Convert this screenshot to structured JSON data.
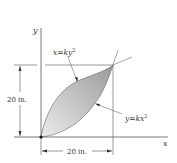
{
  "figure": {
    "axes": {
      "x_label": "x",
      "y_label": "y"
    },
    "curves": [
      {
        "name": "upper-curve",
        "equation_lhs": "x",
        "equation_eq": "=",
        "equation_rhs": "ky",
        "exponent": "2"
      },
      {
        "name": "lower-curve",
        "equation_lhs": "y",
        "equation_eq": "=",
        "equation_rhs": "kx",
        "exponent": "2"
      }
    ],
    "dimensions": {
      "height_label": "20 in.",
      "width_label": "20 in."
    },
    "colors": {
      "shading_light": "#e6e6e6",
      "shading_dark": "#9c9c9c",
      "line": "#555555",
      "text": "#333333"
    }
  }
}
